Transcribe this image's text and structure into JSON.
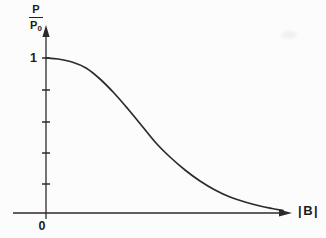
{
  "figure": {
    "background": "#fcfcfc",
    "labels": {
      "y_fraction_numerator": "P",
      "y_fraction_denominator": "P",
      "y_fraction_denominator_sub": "0",
      "y_tick_one": "1",
      "origin": "0",
      "x_axis": "|B|"
    }
  },
  "chart_data": {
    "type": "line",
    "title": "",
    "xlabel": "|B|",
    "ylabel": "P/P0",
    "ylim": [
      0,
      1
    ],
    "grid": false,
    "legend": "none",
    "visible_tick_labels": {
      "y": [
        "1"
      ],
      "x": [
        "0"
      ]
    },
    "unlabeled_y_ticks_at": [
      0.8,
      0.6,
      0.4,
      0.2
    ],
    "series": [
      {
        "name": "P/P0 versus |B|",
        "x_norm": [
          0,
          0.051,
          0.11,
          0.169,
          0.228,
          0.287,
          0.346,
          0.405,
          0.464,
          0.523,
          0.586,
          0.65,
          0.713,
          0.776,
          0.839,
          0.903,
          0.954,
          1.0
        ],
        "y": [
          1.0,
          0.99,
          0.97,
          0.94,
          0.86,
          0.77,
          0.67,
          0.56,
          0.45,
          0.36,
          0.28,
          0.21,
          0.15,
          0.1,
          0.07,
          0.045,
          0.03,
          0.016
        ]
      }
    ],
    "render": {
      "width": 326,
      "height": 238,
      "line_color": "#2b2b2b",
      "axis_color": "#2b2b2b",
      "curve_width": 1.7,
      "axis_width": 1.3,
      "y_axis": {
        "x": 46,
        "y_bottom": 219,
        "y_top": 37,
        "arrow_tip_y": 25,
        "arrow_half_w": 3.6
      },
      "x_axis": {
        "y": 213,
        "x_left": 13,
        "x_right": 280,
        "arrow_tip_x": 292,
        "arrow_half_h": 3.6
      },
      "y_ticks_px": [
        58,
        90,
        122,
        153,
        184
      ],
      "tick_half_len": 4,
      "curve_px": [
        [
          46,
          58
        ],
        [
          58,
          59
        ],
        [
          72,
          62
        ],
        [
          86,
          68
        ],
        [
          100,
          79
        ],
        [
          114,
          93
        ],
        [
          128,
          109
        ],
        [
          142,
          126
        ],
        [
          156,
          143
        ],
        [
          170,
          157
        ],
        [
          185,
          170
        ],
        [
          200,
          181
        ],
        [
          215,
          190
        ],
        [
          230,
          197
        ],
        [
          245,
          202
        ],
        [
          260,
          206
        ],
        [
          272,
          208.5
        ],
        [
          283,
          210.5
        ]
      ]
    }
  }
}
